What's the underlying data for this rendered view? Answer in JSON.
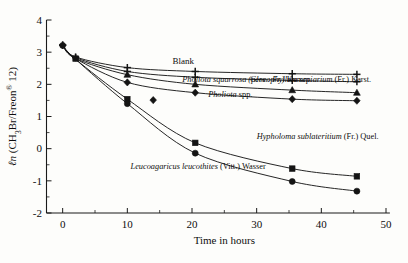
{
  "figure": {
    "background": "#fdfdfb",
    "ink": "#141414"
  },
  "axes": {
    "y_title_parts": {
      "ln": "ℓn",
      "open": " (CH",
      "sub3": "3",
      "mid": "Br/Freon",
      "reg": "®",
      "tail": " 12)"
    },
    "y_title_plain": "ℓn (CH3Br/Freon® 12)",
    "x_title": "Time in hours",
    "y_ticks": [
      "4",
      "3",
      "2",
      "1",
      "0",
      "-1",
      "-2"
    ],
    "x_ticks": [
      "0",
      "10",
      "20",
      "30",
      "40",
      "50"
    ]
  },
  "chart_data": {
    "type": "line",
    "title": "",
    "xlabel": "Time in hours",
    "ylabel": "ℓn (CH3Br/Freon® 12)",
    "xlim": [
      -2.5,
      50
    ],
    "ylim": [
      -2,
      4
    ],
    "grid": false,
    "legend": "inline-annotations",
    "x_ticks": [
      0,
      10,
      20,
      30,
      40,
      50
    ],
    "y_ticks": [
      4,
      3,
      2,
      1,
      0,
      -1,
      -2
    ],
    "series": [
      {
        "name": "Blank",
        "label": "Blank",
        "marker": "plus",
        "label_x": 17.0,
        "label_y": 2.62,
        "points": [
          {
            "x": 0.0,
            "y": 3.22
          },
          {
            "x": 2.0,
            "y": 2.85
          },
          {
            "x": 10.0,
            "y": 2.52
          },
          {
            "x": 20.5,
            "y": 2.4
          },
          {
            "x": 35.5,
            "y": 2.33
          },
          {
            "x": 45.5,
            "y": 2.31
          }
        ]
      },
      {
        "name": "Pholiota squarrosa",
        "label_italic": "Pholiota squarrosa (pers.: Fr.)",
        "label_roman": " Kumm.",
        "label_display": "Pholiota squarrosa (pers.: Fr.) Kumm.",
        "marker": "plus",
        "label_x": 18.5,
        "label_y": 2.07,
        "points": [
          {
            "x": 0.0,
            "y": 3.22
          },
          {
            "x": 2.0,
            "y": 2.83
          },
          {
            "x": 10.0,
            "y": 2.4
          },
          {
            "x": 20.5,
            "y": 2.22
          },
          {
            "x": 35.5,
            "y": 2.12
          },
          {
            "x": 45.5,
            "y": 2.08
          }
        ]
      },
      {
        "name": "Gloeophyllum sepiarium",
        "label_italic": "Gloeophyllum sepiarium",
        "label_roman": " (Fr.) Karst.",
        "label_display": "Gloeophyllum sepiarium (Fr.) Karst.",
        "marker": "triangle",
        "label_x": 29.0,
        "label_y": 2.08,
        "points": [
          {
            "x": 0.0,
            "y": 3.2
          },
          {
            "x": 2.0,
            "y": 2.8
          },
          {
            "x": 10.0,
            "y": 2.3
          },
          {
            "x": 20.5,
            "y": 2.0
          },
          {
            "x": 35.5,
            "y": 1.82
          },
          {
            "x": 45.5,
            "y": 1.74
          }
        ]
      },
      {
        "name": "Pholiota spp.",
        "label_italic": "Pholiota",
        "label_roman": " spp.",
        "label_display": "Pholiota spp.",
        "marker": "diamond",
        "label_x": 22.5,
        "label_y": 1.6,
        "points": [
          {
            "x": 0.0,
            "y": 3.2
          },
          {
            "x": 2.0,
            "y": 2.8
          },
          {
            "x": 10.0,
            "y": 2.06
          },
          {
            "x": 14.0,
            "y": 1.51
          },
          {
            "x": 20.5,
            "y": 1.74
          },
          {
            "x": 35.5,
            "y": 1.54
          },
          {
            "x": 45.5,
            "y": 1.49
          }
        ]
      },
      {
        "name": "Hypholoma sublateritium",
        "label_italic": "Hypholoma sublateritium",
        "label_roman": " (Fr.) Quel.",
        "label_display": "Hypholoma sublateritium (Fr.) Quel.",
        "marker": "square",
        "label_x": 30.0,
        "label_y": 0.3,
        "points": [
          {
            "x": 0.0,
            "y": 3.2
          },
          {
            "x": 2.0,
            "y": 2.78
          },
          {
            "x": 10.0,
            "y": 1.54
          },
          {
            "x": 20.5,
            "y": 0.18
          },
          {
            "x": 35.5,
            "y": -0.62
          },
          {
            "x": 45.5,
            "y": -0.86
          }
        ]
      },
      {
        "name": "Leucoagaricus leucothites",
        "label_italic": "Leucoagaricus leucothites",
        "label_roman": " (Vitt.) Wasser",
        "label_display": "Leucoagaricus leucothites (Vitt.) Wasser",
        "marker": "circle",
        "label_x": 10.5,
        "label_y": -0.62,
        "points": [
          {
            "x": 0.0,
            "y": 3.2
          },
          {
            "x": 2.0,
            "y": 2.78
          },
          {
            "x": 10.0,
            "y": 1.4
          },
          {
            "x": 20.5,
            "y": -0.14
          },
          {
            "x": 35.5,
            "y": -1.02
          },
          {
            "x": 45.5,
            "y": -1.32
          }
        ]
      }
    ]
  }
}
